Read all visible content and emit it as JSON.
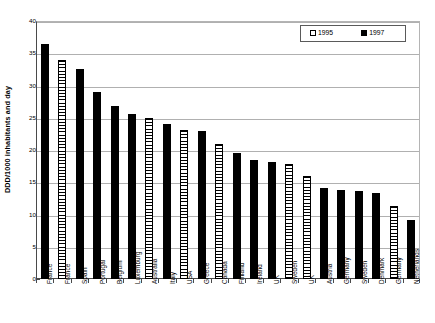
{
  "chart_data": {
    "type": "bar",
    "title": "",
    "xlabel": "",
    "ylabel": "DDD/1000 inhabitants and day",
    "ylim": [
      0,
      40
    ],
    "ytick_step": 5,
    "yticks": [
      0,
      5,
      10,
      15,
      20,
      25,
      30,
      35,
      40
    ],
    "grid": true,
    "legend_position": "top-right",
    "legend": [
      {
        "name": "1995",
        "style": "hatched-white"
      },
      {
        "name": "1997",
        "style": "solid-black"
      }
    ],
    "categories": [
      "France",
      "France",
      "Spain",
      "Portugal",
      "Belgium",
      "Luxemburg",
      "Australia",
      "Italy",
      "USA",
      "Greece",
      "Canada",
      "Finland",
      "Ireland",
      "UK",
      "Sweden",
      "UK",
      "Austria",
      "Germany",
      "Sweden",
      "Denmark",
      "Germany",
      "Netherlands"
    ],
    "bars": [
      {
        "category": "France",
        "series": "1997",
        "value": 36.5
      },
      {
        "category": "France",
        "series": "1995",
        "value": 34.0
      },
      {
        "category": "Spain",
        "series": "1997",
        "value": 32.5
      },
      {
        "category": "Portugal",
        "series": "1997",
        "value": 29.0
      },
      {
        "category": "Belgium",
        "series": "1997",
        "value": 26.8
      },
      {
        "category": "Luxemburg",
        "series": "1997",
        "value": 25.6
      },
      {
        "category": "Australia",
        "series": "1995",
        "value": 25.0
      },
      {
        "category": "Italy",
        "series": "1997",
        "value": 24.1
      },
      {
        "category": "USA",
        "series": "1995",
        "value": 23.1
      },
      {
        "category": "Greece",
        "series": "1997",
        "value": 22.9
      },
      {
        "category": "Canada",
        "series": "1995",
        "value": 21.0
      },
      {
        "category": "Finland",
        "series": "1997",
        "value": 19.5
      },
      {
        "category": "Ireland",
        "series": "1997",
        "value": 18.5
      },
      {
        "category": "UK",
        "series": "1997",
        "value": 18.2
      },
      {
        "category": "Sweden",
        "series": "1995",
        "value": 17.9
      },
      {
        "category": "UK",
        "series": "1995",
        "value": 16.0
      },
      {
        "category": "Austria",
        "series": "1997",
        "value": 14.1
      },
      {
        "category": "Germany",
        "series": "1997",
        "value": 13.8
      },
      {
        "category": "Sweden",
        "series": "1997",
        "value": 13.7
      },
      {
        "category": "Denmark",
        "series": "1997",
        "value": 13.4
      },
      {
        "category": "Germany",
        "series": "1995",
        "value": 11.3
      },
      {
        "category": "Netherlands",
        "series": "1997",
        "value": 9.2
      }
    ],
    "colors": {
      "series_1997": "#000000",
      "series_1995_fill": "#ffffff",
      "series_1995_hatch": "#000000",
      "gridline": "#b0b0b0",
      "axis": "#4a4a4a",
      "background": "#ffffff"
    }
  }
}
